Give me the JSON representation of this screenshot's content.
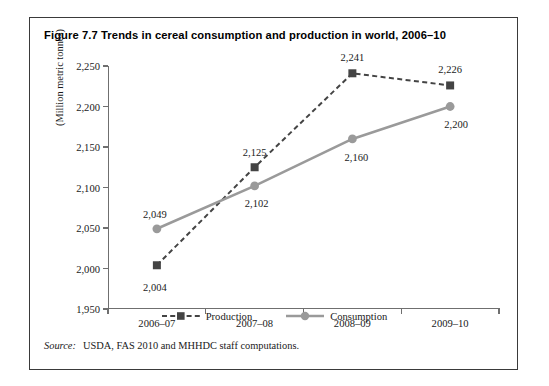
{
  "figure": {
    "title": "Figure 7.7 Trends in cereal consumption and production in world, 2006–10",
    "source_label": "Source:",
    "source_text": "USDA, FAS 2010 and MHHDC staff computations."
  },
  "legend": {
    "production_label": "Production",
    "consumption_label": "Consumption"
  },
  "colors": {
    "production": "#444444",
    "consumption": "#9a9a9a",
    "axis": "#6f6f6f",
    "frame": "#3a3a3a",
    "text": "#1a1a1a"
  },
  "chart_data": {
    "type": "line",
    "title": "Figure 7.7 Trends in cereal consumption and production in world, 2006–10",
    "xlabel": "",
    "ylabel": "(Million metric tonnes)",
    "categories": [
      "2006–07",
      "2007–08",
      "2008–09",
      "2009–10"
    ],
    "ylim": [
      1950,
      2250
    ],
    "yticks": [
      1950,
      2000,
      2050,
      2100,
      2150,
      2200,
      2250
    ],
    "ytick_labels": [
      "1,950",
      "2,000",
      "2,050",
      "2,100",
      "2,150",
      "2,200",
      "2,250"
    ],
    "grid": false,
    "legend_position": "bottom",
    "series": [
      {
        "name": "Production",
        "values": [
          2004,
          2125,
          2241,
          2226
        ],
        "data_labels": [
          "2,004",
          "2,125",
          "2,241",
          "2,226"
        ],
        "style": "dashed",
        "marker": "square",
        "color": "#444444"
      },
      {
        "name": "Consumption",
        "values": [
          2049,
          2102,
          2160,
          2200
        ],
        "data_labels": [
          "2,049",
          "2,102",
          "2,160",
          "2,200"
        ],
        "style": "solid",
        "marker": "circle",
        "color": "#9a9a9a"
      }
    ]
  }
}
